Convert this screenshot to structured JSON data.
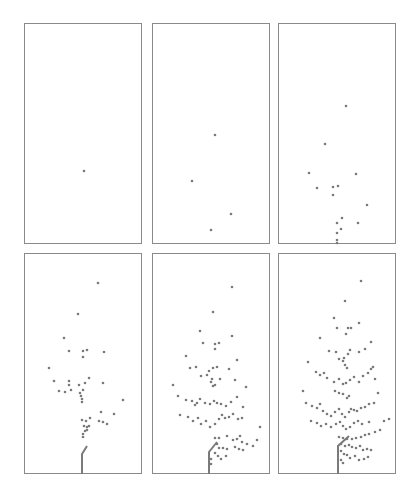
{
  "chart_data": {
    "type": "scatter",
    "title": "",
    "xlabel": "",
    "ylabel": "",
    "grid": false,
    "legend": null,
    "point_color": "#7a7a7a",
    "frame_color": "#8a8a8a",
    "panel_size": [
      118,
      221
    ],
    "panels": [
      {
        "id": 1,
        "row": 0,
        "col": 0,
        "origin": [
          24,
          23
        ],
        "points": [
          [
            59,
            147
          ]
        ],
        "stem": null
      },
      {
        "id": 2,
        "row": 0,
        "col": 1,
        "origin": [
          152,
          23
        ],
        "points": [
          [
            62,
            111
          ],
          [
            39,
            157
          ],
          [
            78,
            190
          ],
          [
            58,
            206
          ]
        ],
        "stem": null
      },
      {
        "id": 3,
        "row": 0,
        "col": 2,
        "origin": [
          278,
          23
        ],
        "points": [
          [
            67,
            82
          ],
          [
            46,
            120
          ],
          [
            30,
            149
          ],
          [
            77,
            150
          ],
          [
            38,
            164
          ],
          [
            54,
            163
          ],
          [
            59,
            162
          ],
          [
            54,
            171
          ],
          [
            88,
            181
          ],
          [
            58,
            199
          ],
          [
            79,
            199
          ],
          [
            63,
            194
          ],
          [
            62,
            205
          ],
          [
            58,
            209
          ],
          [
            58,
            216
          ],
          [
            58,
            219
          ]
        ],
        "stem": null
      },
      {
        "id": 4,
        "row": 1,
        "col": 0,
        "origin": [
          24,
          253
        ],
        "points": [
          [
            73,
            29
          ],
          [
            53,
            60
          ],
          [
            39,
            84
          ],
          [
            44,
            97
          ],
          [
            58,
            97
          ],
          [
            62,
            96
          ],
          [
            58,
            103
          ],
          [
            79,
            98
          ],
          [
            24,
            114
          ],
          [
            29,
            127
          ],
          [
            44,
            127
          ],
          [
            34,
            137
          ],
          [
            40,
            138
          ],
          [
            44,
            131
          ],
          [
            46,
            136
          ],
          [
            54,
            131
          ],
          [
            60,
            129
          ],
          [
            64,
            124
          ],
          [
            58,
            136
          ],
          [
            78,
            129
          ],
          [
            55,
            139
          ],
          [
            56,
            142
          ],
          [
            57,
            145
          ],
          [
            57,
            148
          ],
          [
            98,
            146
          ],
          [
            76,
            158
          ],
          [
            89,
            160
          ],
          [
            57,
            166
          ],
          [
            61,
            167
          ],
          [
            65,
            164
          ],
          [
            74,
            167
          ],
          [
            78,
            168
          ],
          [
            82,
            170
          ],
          [
            59,
            172
          ],
          [
            62,
            173
          ],
          [
            64,
            172
          ],
          [
            60,
            177
          ],
          [
            62,
            176
          ],
          [
            58,
            180
          ],
          [
            58,
            183
          ]
        ],
        "stem": [
          [
            57,
            220
          ],
          [
            57,
            200
          ],
          [
            62,
            192
          ]
        ]
      },
      {
        "id": 5,
        "row": 1,
        "col": 1,
        "origin": [
          152,
          253
        ],
        "points": [
          [
            79,
            33
          ],
          [
            60,
            58
          ],
          [
            47,
            77
          ],
          [
            50,
            89
          ],
          [
            62,
            90
          ],
          [
            66,
            89
          ],
          [
            62,
            95
          ],
          [
            79,
            82
          ],
          [
            33,
            102
          ],
          [
            84,
            106
          ],
          [
            37,
            114
          ],
          [
            43,
            113
          ],
          [
            48,
            122
          ],
          [
            54,
            121
          ],
          [
            56,
            117
          ],
          [
            60,
            114
          ],
          [
            64,
            113
          ],
          [
            67,
            125
          ],
          [
            59,
            125
          ],
          [
            58,
            128
          ],
          [
            60,
            132
          ],
          [
            62,
            131
          ],
          [
            76,
            115
          ],
          [
            82,
            126
          ],
          [
            20,
            131
          ],
          [
            93,
            133
          ],
          [
            25,
            142
          ],
          [
            33,
            146
          ],
          [
            39,
            147
          ],
          [
            42,
            151
          ],
          [
            44,
            149
          ],
          [
            47,
            145
          ],
          [
            52,
            149
          ],
          [
            57,
            150
          ],
          [
            61,
            147
          ],
          [
            64,
            149
          ],
          [
            68,
            150
          ],
          [
            73,
            152
          ],
          [
            78,
            148
          ],
          [
            84,
            143
          ],
          [
            90,
            153
          ],
          [
            27,
            161
          ],
          [
            35,
            163
          ],
          [
            40,
            167
          ],
          [
            45,
            164
          ],
          [
            48,
            170
          ],
          [
            53,
            167
          ],
          [
            57,
            173
          ],
          [
            62,
            170
          ],
          [
            66,
            165
          ],
          [
            69,
            161
          ],
          [
            72,
            164
          ],
          [
            76,
            163
          ],
          [
            80,
            160
          ],
          [
            85,
            165
          ],
          [
            89,
            164
          ],
          [
            107,
            173
          ],
          [
            62,
            184
          ],
          [
            66,
            184
          ],
          [
            74,
            182
          ],
          [
            80,
            186
          ],
          [
            84,
            185
          ],
          [
            87,
            182
          ],
          [
            89,
            188
          ],
          [
            94,
            190
          ],
          [
            64,
            190
          ],
          [
            66,
            194
          ],
          [
            70,
            194
          ],
          [
            74,
            195
          ],
          [
            82,
            193
          ],
          [
            86,
            195
          ],
          [
            90,
            196
          ],
          [
            100,
            192
          ],
          [
            104,
            186
          ],
          [
            62,
            199
          ],
          [
            65,
            202
          ],
          [
            68,
            205
          ],
          [
            73,
            202
          ],
          [
            58,
            210
          ],
          [
            58,
            205
          ]
        ],
        "stem": [
          [
            56,
            220
          ],
          [
            56,
            198
          ],
          [
            64,
            188
          ]
        ]
      },
      {
        "id": 6,
        "row": 1,
        "col": 2,
        "origin": [
          278,
          253
        ],
        "points": [
          [
            82,
            27
          ],
          [
            66,
            47
          ],
          [
            55,
            64
          ],
          [
            58,
            74
          ],
          [
            69,
            74
          ],
          [
            72,
            74
          ],
          [
            67,
            80
          ],
          [
            80,
            69
          ],
          [
            92,
            88
          ],
          [
            41,
            84
          ],
          [
            50,
            97
          ],
          [
            57,
            98
          ],
          [
            60,
            105
          ],
          [
            65,
            104
          ],
          [
            69,
            100
          ],
          [
            71,
            96
          ],
          [
            80,
            98
          ],
          [
            86,
            95
          ],
          [
            64,
            107
          ],
          [
            66,
            111
          ],
          [
            68,
            114
          ],
          [
            92,
            115
          ],
          [
            29,
            108
          ],
          [
            37,
            118
          ],
          [
            41,
            121
          ],
          [
            45,
            119
          ],
          [
            48,
            124
          ],
          [
            55,
            128
          ],
          [
            60,
            125
          ],
          [
            64,
            130
          ],
          [
            67,
            129
          ],
          [
            71,
            126
          ],
          [
            75,
            123
          ],
          [
            80,
            128
          ],
          [
            84,
            122
          ],
          [
            89,
            119
          ],
          [
            94,
            113
          ],
          [
            96,
            125
          ],
          [
            56,
            137
          ],
          [
            60,
            139
          ],
          [
            64,
            140
          ],
          [
            68,
            144
          ],
          [
            70,
            142
          ],
          [
            24,
            137
          ],
          [
            99,
            139
          ],
          [
            27,
            149
          ],
          [
            33,
            152
          ],
          [
            38,
            154
          ],
          [
            41,
            150
          ],
          [
            44,
            157
          ],
          [
            48,
            160
          ],
          [
            52,
            162
          ],
          [
            56,
            158
          ],
          [
            60,
            155
          ],
          [
            63,
            160
          ],
          [
            66,
            163
          ],
          [
            70,
            158
          ],
          [
            72,
            155
          ],
          [
            75,
            156
          ],
          [
            78,
            157
          ],
          [
            82,
            154
          ],
          [
            86,
            153
          ],
          [
            90,
            150
          ],
          [
            95,
            149
          ],
          [
            32,
            167
          ],
          [
            38,
            169
          ],
          [
            42,
            172
          ],
          [
            47,
            170
          ],
          [
            52,
            173
          ],
          [
            57,
            170
          ],
          [
            61,
            168
          ],
          [
            64,
            172
          ],
          [
            67,
            175
          ],
          [
            71,
            173
          ],
          [
            75,
            169
          ],
          [
            79,
            167
          ],
          [
            83,
            170
          ],
          [
            90,
            168
          ],
          [
            105,
            167
          ],
          [
            110,
            165
          ],
          [
            60,
            183
          ],
          [
            64,
            184
          ],
          [
            68,
            185
          ],
          [
            73,
            185
          ],
          [
            77,
            184
          ],
          [
            82,
            183
          ],
          [
            86,
            181
          ],
          [
            90,
            180
          ],
          [
            96,
            178
          ],
          [
            101,
            176
          ],
          [
            62,
            190
          ],
          [
            66,
            192
          ],
          [
            70,
            191
          ],
          [
            73,
            193
          ],
          [
            77,
            194
          ],
          [
            81,
            192
          ],
          [
            84,
            196
          ],
          [
            88,
            195
          ],
          [
            92,
            196
          ],
          [
            62,
            197
          ],
          [
            65,
            200
          ],
          [
            68,
            201
          ],
          [
            71,
            204
          ],
          [
            76,
            202
          ],
          [
            80,
            206
          ],
          [
            85,
            205
          ],
          [
            89,
            203
          ],
          [
            62,
            206
          ],
          [
            64,
            209
          ]
        ],
        "stem": [
          [
            59,
            220
          ],
          [
            59,
            192
          ],
          [
            70,
            182
          ]
        ]
      }
    ]
  }
}
